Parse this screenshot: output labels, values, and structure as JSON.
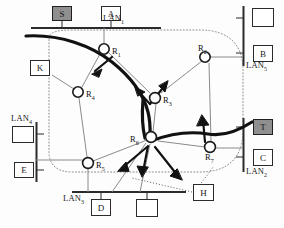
{
  "figure": {
    "type": "network-topology-diagram",
    "colors": {
      "line": "#2b2b2b",
      "thick_path": "#111111",
      "dotted_boundary": "#8a8a8a",
      "thin_link": "#8a8a8a",
      "host_fill": "#ffffff",
      "host_fill_highlight": "#8f8f8f",
      "background": "#ffffff"
    }
  },
  "lans": [
    {
      "id": "lan1",
      "label": "LAN",
      "sub": "1"
    },
    {
      "id": "lan2",
      "label": "LAN",
      "sub": "2"
    },
    {
      "id": "lan3",
      "label": "LAN",
      "sub": "3"
    },
    {
      "id": "lan4",
      "label": "LAN",
      "sub": "4"
    },
    {
      "id": "lan5",
      "label": "LAN",
      "sub": "5"
    }
  ],
  "hosts": [
    {
      "id": "host-s",
      "label": "S",
      "highlighted": true,
      "lan": "lan1"
    },
    {
      "id": "host-a",
      "label": "A",
      "highlighted": false,
      "lan": "lan1"
    },
    {
      "id": "host-k",
      "label": "K",
      "highlighted": false,
      "lan": null
    },
    {
      "id": "host-e",
      "label": "E",
      "highlighted": false,
      "lan": "lan4"
    },
    {
      "id": "host-lan4-top",
      "label": "",
      "highlighted": false,
      "lan": "lan4"
    },
    {
      "id": "host-d",
      "label": "D",
      "highlighted": false,
      "lan": "lan3"
    },
    {
      "id": "host-lan3-right",
      "label": "",
      "highlighted": false,
      "lan": "lan3"
    },
    {
      "id": "host-lan5-top",
      "label": "",
      "highlighted": false,
      "lan": "lan5"
    },
    {
      "id": "host-b",
      "label": "B",
      "highlighted": false,
      "lan": "lan5"
    },
    {
      "id": "host-t",
      "label": "T",
      "highlighted": true,
      "lan": "lan2"
    },
    {
      "id": "host-c",
      "label": "C",
      "highlighted": false,
      "lan": "lan2"
    },
    {
      "id": "host-h",
      "label": "H",
      "highlighted": false,
      "lan": null
    }
  ],
  "routers": [
    {
      "id": "r1",
      "label": "R",
      "sub": "1"
    },
    {
      "id": "r2",
      "label": "R",
      "sub": "2"
    },
    {
      "id": "r3",
      "label": "R",
      "sub": "3"
    },
    {
      "id": "r4",
      "label": "R",
      "sub": "4"
    },
    {
      "id": "r5",
      "label": "R",
      "sub": "5"
    },
    {
      "id": "r6",
      "label": "R",
      "sub": "6"
    },
    {
      "id": "r7",
      "label": "R",
      "sub": "7"
    }
  ]
}
